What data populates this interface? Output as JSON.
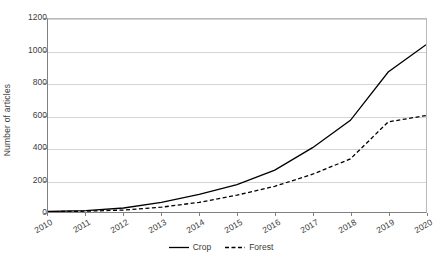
{
  "chart_data": {
    "type": "line",
    "title": "",
    "xlabel": "",
    "ylabel": "Number of articles",
    "categories": [
      "2010",
      "2011",
      "2012",
      "2013",
      "2014",
      "2015",
      "2016",
      "2017",
      "2018",
      "2019",
      "2020"
    ],
    "x": [
      2010,
      2011,
      2012,
      2013,
      2014,
      2015,
      2016,
      2017,
      2018,
      2019,
      2020
    ],
    "series": [
      {
        "name": "Crop",
        "style": "solid",
        "color": "#000000",
        "values": [
          3,
          8,
          25,
          60,
          110,
          170,
          260,
          400,
          570,
          870,
          1040
        ]
      },
      {
        "name": "Forest",
        "style": "dashed",
        "color": "#000000",
        "values": [
          2,
          5,
          12,
          30,
          60,
          105,
          160,
          235,
          330,
          560,
          600
        ]
      }
    ],
    "ylim": [
      0,
      1200
    ],
    "yticks": [
      0,
      200,
      400,
      600,
      800,
      1000,
      1200
    ],
    "ytick_labels": [
      "0",
      "200",
      "400",
      "600",
      "800",
      "1000",
      "1200"
    ],
    "grid": true,
    "grid_axis": "y",
    "legend_position": "bottom",
    "legend": [
      "Crop",
      "Forest"
    ]
  }
}
